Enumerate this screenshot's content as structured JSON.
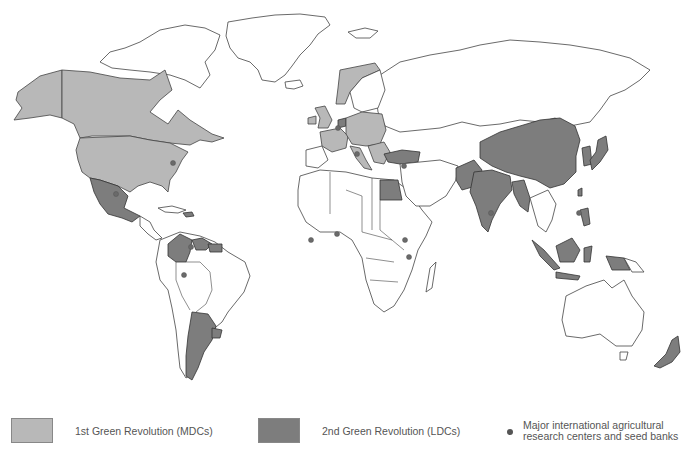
{
  "map": {
    "type": "world choropleth",
    "categories": [
      {
        "id": "mdc",
        "label": "1st Green Revolution (MDCs)",
        "color": "#b8b8b8"
      },
      {
        "id": "ldc",
        "label": "2nd Green Revolution (LDCs)",
        "color": "#7d7d7d"
      },
      {
        "id": "other",
        "label": "",
        "color": "#ffffff"
      }
    ],
    "regions_mdc": [
      "Canada",
      "United States",
      "Alaska",
      "Norway",
      "United Kingdom",
      "Ireland",
      "France",
      "Germany",
      "Poland",
      "Central Europe",
      "Italy",
      "Balkans",
      "Greece"
    ],
    "regions_ldc": [
      "Mexico",
      "Colombia",
      "Venezuela",
      "Guyana",
      "Argentina",
      "Uruguay",
      "Turkey",
      "Egypt",
      "Pakistan",
      "India",
      "Bangladesh",
      "Myanmar",
      "China",
      "North Korea",
      "South Korea",
      "Japan",
      "Taiwan",
      "Philippines",
      "Malaysia",
      "Indonesia",
      "Papua New Guinea",
      "New Zealand",
      "Belgium/Netherlands"
    ],
    "research_centers_count": 12
  },
  "legend": {
    "item1": {
      "label": "1st Green Revolution (MDCs)",
      "color": "#b8b8b8"
    },
    "item2": {
      "label": "2nd Green Revolution (LDCs)",
      "color": "#7d7d7d"
    },
    "item3": {
      "line1": "Major international agricultural",
      "line2": "research centers and seed banks",
      "color": "#555555"
    }
  }
}
